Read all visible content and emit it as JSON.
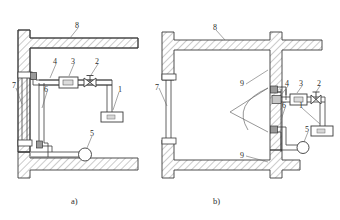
{
  "figure": {
    "type": "engineering-schematic",
    "panel_count": 2,
    "stroke_color": "#3a3a3a",
    "hatch_color": "#5a5a5a",
    "background": "#ffffff"
  },
  "panels": [
    {
      "id": "a",
      "caption": "a)",
      "callouts": [
        {
          "key": "1",
          "label": "1"
        },
        {
          "key": "2",
          "label": "2"
        },
        {
          "key": "3",
          "label": "3"
        },
        {
          "key": "4",
          "label": "4"
        },
        {
          "key": "5",
          "label": "5"
        },
        {
          "key": "6",
          "label": "6"
        },
        {
          "key": "7",
          "label": "7"
        },
        {
          "key": "8",
          "label": "8"
        }
      ]
    },
    {
      "id": "b",
      "caption": "b)",
      "callouts": [
        {
          "key": "1",
          "label": "1"
        },
        {
          "key": "2",
          "label": "2"
        },
        {
          "key": "3",
          "label": "3"
        },
        {
          "key": "4",
          "label": "4"
        },
        {
          "key": "5",
          "label": "5"
        },
        {
          "key": "6",
          "label": "6"
        },
        {
          "key": "7",
          "label": "7"
        },
        {
          "key": "8",
          "label": "8"
        },
        {
          "key": "9a",
          "label": "9"
        },
        {
          "key": "9b",
          "label": "9"
        }
      ]
    }
  ],
  "labels": {
    "a1": "1",
    "a2": "2",
    "a3": "3",
    "a4": "4",
    "a5": "5",
    "a6": "6",
    "a7": "7",
    "a8": "8",
    "b1": "1",
    "b2": "2",
    "b3": "3",
    "b4": "4",
    "b5": "5",
    "b6": "6",
    "b7": "7",
    "b8": "8",
    "b9_top": "9",
    "b9_bottom": "9",
    "caption_a": "a)",
    "caption_b": "b)"
  }
}
